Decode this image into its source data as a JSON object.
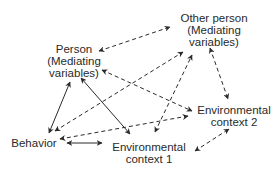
{
  "nodes": {
    "other_person": {
      "line1": "Other person",
      "line2": "(Mediating",
      "line3": "variables)"
    },
    "person": {
      "line1": "Person",
      "line2": "(Mediating",
      "line3": "variables)"
    },
    "env2": {
      "line1": "Environmental",
      "line2": "context 2"
    },
    "behavior": {
      "line1": "Behavior"
    },
    "env1": {
      "line1": "Environmental",
      "line2": "context 1"
    }
  },
  "edges": [
    {
      "from": "behavior",
      "to": "person",
      "style": "solid",
      "direction": "both"
    },
    {
      "from": "person",
      "to": "env1",
      "style": "solid",
      "direction": "both"
    },
    {
      "from": "behavior",
      "to": "env1",
      "style": "solid",
      "direction": "both"
    },
    {
      "from": "person",
      "to": "other_person",
      "style": "dashed",
      "direction": "both"
    },
    {
      "from": "person",
      "to": "env2",
      "style": "dashed",
      "direction": "both"
    },
    {
      "from": "behavior",
      "to": "other_person",
      "style": "dashed",
      "direction": "both"
    },
    {
      "from": "behavior",
      "to": "env2",
      "style": "dashed",
      "direction": "both"
    },
    {
      "from": "env1",
      "to": "other_person",
      "style": "dashed",
      "direction": "both"
    },
    {
      "from": "other_person",
      "to": "env2",
      "style": "dashed",
      "direction": "both"
    },
    {
      "from": "env1",
      "to": "env2",
      "style": "dashed",
      "direction": "both"
    }
  ],
  "colors": {
    "line": "#2a2a2a",
    "background": "#ffffff"
  }
}
